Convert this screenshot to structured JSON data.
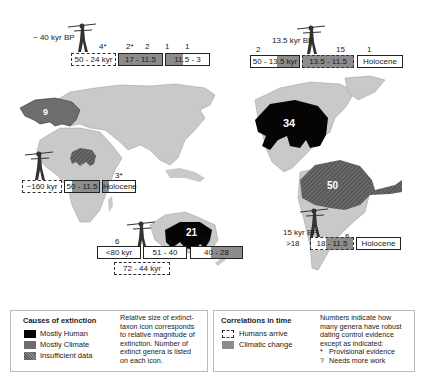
{
  "colors": {
    "land": "#c9c9c9",
    "mostly_human": "#050505",
    "mostly_climate": "#6d6d6d",
    "insufficient_data": "#5a5a5a",
    "climatic_change": "#8c8c8c"
  },
  "regions": {
    "eurasia": {
      "arrival": "~ 40 kyr BP",
      "counts": [
        "4*",
        "2*",
        "2",
        "1",
        "1"
      ],
      "boxes": [
        "50 - 24 kyr",
        "17 - 11.5",
        "11.5 - 3"
      ],
      "icon_count": "9"
    },
    "north_america": {
      "arrival": "13.5 kyr BP",
      "counts": [
        "2",
        "15",
        "1"
      ],
      "boxes": [
        "50 - 13.5 kyr",
        "13.5 - 11.5",
        "Holocene"
      ],
      "icon_count": "34"
    },
    "africa": {
      "counts": [
        "3*"
      ],
      "boxes": [
        "~160 kyr",
        "50 - 11.5",
        "Holocene"
      ],
      "icon_count": "1"
    },
    "australia": {
      "counts": [
        "6",
        "6",
        "1?"
      ],
      "boxes": [
        "<80 kyr",
        "51 - 40",
        "40 - 28",
        "72 - 44 kyr"
      ],
      "icon_count": "21"
    },
    "south_america": {
      "arrival": "15 kyr BP",
      "counts": [
        ">18",
        "6"
      ],
      "boxes": [
        "18 - 11.5",
        "Holocene"
      ],
      "icon_count": "50"
    }
  },
  "legend": {
    "causes_title": "Causes of extinction",
    "causes": [
      "Mostly Human",
      "Mostly Climate",
      "Insufficient data"
    ],
    "size_note": [
      "Relative size of extinct-",
      "taxon icon corresponds",
      "to relative magnitude of",
      "extinction.  Number of",
      "extinct genera is listed",
      "on each icon."
    ],
    "correlations_title": "Correlations in time",
    "correlations": [
      "Humans arrive",
      "Climatic change"
    ],
    "numbers_note": [
      "Numbers indicate how",
      "many genera have robust",
      "dating control evidence",
      "except as indicated:"
    ],
    "marks": [
      {
        "symbol": "*",
        "text": "Provisional evidence"
      },
      {
        "symbol": "?",
        "text": "Needs more work"
      }
    ]
  }
}
